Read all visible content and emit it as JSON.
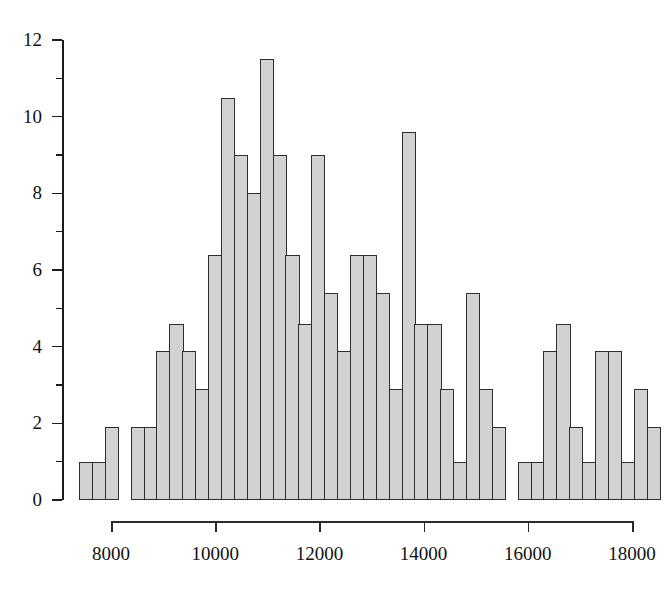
{
  "chart_data": {
    "type": "bar",
    "title": "",
    "subtitle": "",
    "xlabel": "",
    "ylabel": "",
    "grid": false,
    "legend": "none",
    "xlim": [
      7380,
      18630
    ],
    "ylim": [
      0,
      12
    ],
    "bin_width": 250,
    "x_ticks": [
      8000,
      10000,
      12000,
      14000,
      16000,
      18000
    ],
    "x_tick_labels": [
      "8000",
      "10000",
      "12000",
      "14000",
      "16000",
      "18000"
    ],
    "y_ticks": [
      0,
      2,
      4,
      6,
      8,
      10,
      12
    ],
    "y_tick_labels": [
      "0",
      "2",
      "4",
      "6",
      "8",
      "10",
      "12"
    ],
    "y_minor_ticks": [
      1,
      3,
      5,
      7,
      9,
      11
    ],
    "bar_color": "#d2d2d2",
    "bar_edge_color": "#2e2e2e",
    "axis_color": "#1c1c1c",
    "bin_starts": [
      7380,
      7630,
      7880,
      8130,
      8380,
      8630,
      8880,
      9130,
      9380,
      9630,
      9880,
      10130,
      10380,
      10630,
      10880,
      11130,
      11380,
      11630,
      11880,
      12130,
      12380,
      12630,
      12880,
      13130,
      13380,
      13630,
      13880,
      14130,
      14380,
      14630,
      14880,
      15130,
      15380,
      15630,
      15880,
      16130,
      16380,
      16630,
      16880,
      17130,
      17380,
      17630,
      17880,
      18130,
      18380
    ],
    "categories": [
      "7380",
      "7630",
      "7880",
      "8130",
      "8380",
      "8630",
      "8880",
      "9130",
      "9380",
      "9630",
      "9880",
      "10130",
      "10380",
      "10630",
      "10880",
      "11130",
      "11380",
      "11630",
      "11880",
      "12130",
      "12380",
      "12630",
      "12880",
      "13130",
      "13380",
      "13630",
      "13880",
      "14130",
      "14380",
      "14630",
      "14880",
      "15130",
      "15380",
      "15630",
      "15880",
      "16130",
      "16380",
      "16630",
      "16880",
      "17130",
      "17380",
      "17630",
      "17880",
      "18130",
      "18380"
    ],
    "values": [
      1,
      1,
      1.9,
      0,
      1.9,
      1.9,
      3.9,
      4.6,
      3.9,
      2.9,
      6.4,
      10.5,
      9,
      8,
      11.5,
      9,
      6.4,
      4.6,
      9,
      5.4,
      3.9,
      6.4,
      6.4,
      5.4,
      2.9,
      9.6,
      4.6,
      4.6,
      2.9,
      1,
      5.4,
      2.9,
      1.9,
      0,
      1,
      1,
      3.9,
      4.6,
      1.9,
      1,
      3.9,
      3.9,
      1,
      2.9,
      1.9
    ],
    "series": [
      {
        "name": "frequency",
        "values": [
          1,
          1,
          1.9,
          0,
          1.9,
          1.9,
          3.9,
          4.6,
          3.9,
          2.9,
          6.4,
          10.5,
          9,
          8,
          11.5,
          9,
          6.4,
          4.6,
          9,
          5.4,
          3.9,
          6.4,
          6.4,
          5.4,
          2.9,
          9.6,
          4.6,
          4.6,
          2.9,
          1,
          5.4,
          2.9,
          1.9,
          0,
          1,
          1,
          3.9,
          4.6,
          1.9,
          1,
          3.9,
          3.9,
          1,
          2.9,
          1.9
        ]
      }
    ]
  }
}
